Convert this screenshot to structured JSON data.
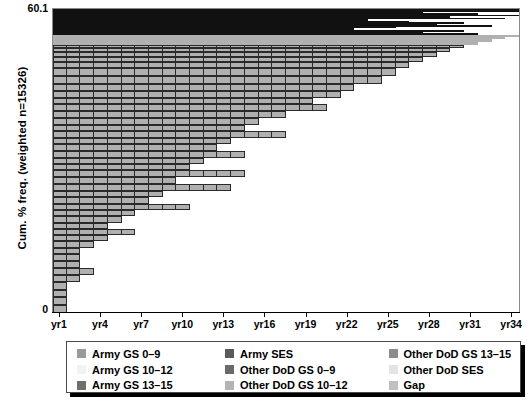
{
  "chart_data": {
    "type": "bar",
    "subtype": "stacked-cumulative-mosaic",
    "title": "",
    "xlabel": "",
    "ylabel": "Cum. % freq. (weighted n=15326)",
    "ylim": [
      0,
      60.1
    ],
    "y_ticks": [
      "0",
      "60.1"
    ],
    "x_tick_labels": [
      "yr1",
      "yr4",
      "yr7",
      "yr10",
      "yr13",
      "yr16",
      "yr19",
      "yr22",
      "yr25",
      "yr28",
      "yr31",
      "yr34"
    ],
    "x_tick_positions": [
      1,
      4,
      7,
      10,
      13,
      16,
      19,
      22,
      25,
      28,
      31,
      34
    ],
    "x_range": [
      1,
      34
    ],
    "grid": false,
    "legend_position": "bottom",
    "categories": [
      "yr1",
      "yr2",
      "yr3",
      "yr4",
      "yr5",
      "yr6",
      "yr7",
      "yr8",
      "yr9",
      "yr10",
      "yr11",
      "yr12",
      "yr13",
      "yr14",
      "yr15",
      "yr16",
      "yr17",
      "yr18",
      "yr19",
      "yr20",
      "yr21",
      "yr22",
      "yr23",
      "yr24",
      "yr25",
      "yr26",
      "yr27",
      "yr28",
      "yr29",
      "yr30",
      "yr31",
      "yr32",
      "yr33",
      "yr34"
    ],
    "series": [
      {
        "name": "Army GS 0-9",
        "color": "#9a9a9a"
      },
      {
        "name": "Army GS 10-12",
        "color": "#f0f0f0"
      },
      {
        "name": "Army GS 13-15",
        "color": "#6e6e6e"
      },
      {
        "name": "Army SES",
        "color": "#5a5a5a"
      },
      {
        "name": "Other DoD GS 0-9",
        "color": "#7a7a7a"
      },
      {
        "name": "Other DoD GS 10-12",
        "color": "#aeaeae"
      },
      {
        "name": "Other DoD GS 13-15",
        "color": "#8c8c8c"
      },
      {
        "name": "Other DoD SES",
        "color": "#e2e2e2"
      },
      {
        "name": "Gap",
        "color": "#bdbdbd"
      }
    ],
    "rows": [
      {
        "y": 0,
        "h": 2,
        "span": 34,
        "cells": 34,
        "fill": "#111111"
      },
      {
        "y": 2,
        "h": 1.2,
        "span": 34,
        "cells": 34,
        "fill": "#111111"
      },
      {
        "y": 3.2,
        "h": 1.2,
        "span": 27,
        "cells": 27,
        "fill": "#111111"
      },
      {
        "y": 4.4,
        "h": 1.4,
        "span": 31,
        "cells": 31,
        "fill": "#111111"
      },
      {
        "y": 5.8,
        "h": 1.2,
        "span": 34,
        "cells": 34,
        "fill": "#111111"
      },
      {
        "y": 7.0,
        "h": 1.6,
        "span": 29,
        "cells": 29,
        "fill": "#111111"
      },
      {
        "y": 8.6,
        "h": 1.2,
        "span": 33,
        "cells": 33,
        "fill": "#111111"
      },
      {
        "y": 9.8,
        "h": 2.0,
        "span": 23,
        "cells": 23,
        "fill": "#111111"
      },
      {
        "y": 11.8,
        "h": 1.4,
        "span": 26,
        "cells": 26,
        "fill": "#111111"
      },
      {
        "y": 13.2,
        "h": 1.6,
        "span": 30,
        "cells": 30,
        "fill": "#111111"
      },
      {
        "y": 14.8,
        "h": 1.4,
        "span": 28,
        "cells": 28,
        "fill": "#111111"
      },
      {
        "y": 16.2,
        "h": 1.6,
        "span": 32,
        "cells": 32,
        "fill": "#111111"
      },
      {
        "y": 17.8,
        "h": 1.4,
        "span": 25,
        "cells": 25,
        "fill": "#111111"
      },
      {
        "y": 19.2,
        "h": 1.8,
        "span": 22,
        "cells": 22,
        "fill": "#111111"
      },
      {
        "y": 21.0,
        "h": 1.6,
        "span": 30,
        "cells": 30,
        "fill": "#111111"
      },
      {
        "y": 22.6,
        "h": 1.8,
        "span": 27,
        "cells": 27,
        "fill": "#111111"
      },
      {
        "y": 24.4,
        "h": 1.6,
        "span": 31,
        "cells": 31,
        "fill": "#111111"
      },
      {
        "y": 26.0,
        "h": 2.0,
        "span": 34,
        "cells": 34,
        "fill": "#b0b0b0"
      },
      {
        "y": 28.0,
        "h": 2.4,
        "span": 33,
        "cells": 33,
        "fill": "#b0b0b0"
      },
      {
        "y": 30.4,
        "h": 2.4,
        "span": 32,
        "cells": 32,
        "fill": "#b0b0b0"
      },
      {
        "y": 32.8,
        "h": 3.0,
        "span": 31,
        "cells": 31,
        "fill": "#b0b0b0"
      },
      {
        "y": 35.8,
        "h": 3.4,
        "span": 30,
        "cells": 30,
        "fill": "#b0b0b0"
      },
      {
        "y": 39.2,
        "h": 4.0,
        "span": 29,
        "cells": 29,
        "fill": "#b0b0b0"
      },
      {
        "y": 43.2,
        "h": 4.6,
        "span": 28,
        "cells": 28,
        "fill": "#b0b0b0"
      },
      {
        "y": 47.8,
        "h": 5.4,
        "span": 27,
        "cells": 27,
        "fill": "#b0b0b0"
      },
      {
        "y": 53.2,
        "h": 6.4,
        "span": 26,
        "cells": 26,
        "fill": "#b0b0b0"
      },
      {
        "y": 59.6,
        "h": 7.4,
        "span": 25,
        "cells": 25,
        "fill": "#b0b0b0"
      },
      {
        "y": 67.0,
        "h": 8.2,
        "span": 24,
        "cells": 24,
        "fill": "#b0b0b0"
      },
      {
        "y": 75.2,
        "h": 6.6,
        "span": 22,
        "cells": 22,
        "fill": "#b0b0b0"
      },
      {
        "y": 81.8,
        "h": 7.6,
        "span": 21,
        "cells": 21,
        "fill": "#b0b0b0"
      },
      {
        "y": 89.4,
        "h": 6.2,
        "span": 19,
        "cells": 19,
        "fill": "#b0b0b0"
      },
      {
        "y": 95.6,
        "h": 7.0,
        "span": 20,
        "cells": 20,
        "fill": "#b0b0b0"
      },
      {
        "y": 102.6,
        "h": 6.4,
        "span": 17,
        "cells": 17,
        "fill": "#b0b0b0"
      },
      {
        "y": 109.0,
        "h": 7.2,
        "span": 15,
        "cells": 15,
        "fill": "#b0b0b0"
      },
      {
        "y": 116.2,
        "h": 6.0,
        "span": 14,
        "cells": 14,
        "fill": "#b0b0b0"
      },
      {
        "y": 122.2,
        "h": 7.4,
        "span": 17,
        "cells": 17,
        "fill": "#b0b0b0"
      },
      {
        "y": 129.6,
        "h": 6.2,
        "span": 13,
        "cells": 13,
        "fill": "#b0b0b0"
      },
      {
        "y": 135.8,
        "h": 6.6,
        "span": 12,
        "cells": 12,
        "fill": "#b0b0b0"
      },
      {
        "y": 142.4,
        "h": 7.0,
        "span": 14,
        "cells": 14,
        "fill": "#b0b0b0"
      },
      {
        "y": 149.4,
        "h": 6.4,
        "span": 11,
        "cells": 11,
        "fill": "#b0b0b0"
      },
      {
        "y": 155.8,
        "h": 6.0,
        "span": 10,
        "cells": 10,
        "fill": "#b0b0b0"
      },
      {
        "y": 161.8,
        "h": 7.2,
        "span": 14,
        "cells": 14,
        "fill": "#b0b0b0"
      },
      {
        "y": 169.0,
        "h": 6.4,
        "span": 9,
        "cells": 9,
        "fill": "#b0b0b0"
      },
      {
        "y": 175.4,
        "h": 7.0,
        "span": 13,
        "cells": 13,
        "fill": "#b0b0b0"
      },
      {
        "y": 182.4,
        "h": 6.6,
        "span": 8,
        "cells": 8,
        "fill": "#b0b0b0"
      },
      {
        "y": 189.0,
        "h": 6.2,
        "span": 7,
        "cells": 7,
        "fill": "#b0b0b0"
      },
      {
        "y": 195.2,
        "h": 6.8,
        "span": 10,
        "cells": 10,
        "fill": "#b0b0b0"
      },
      {
        "y": 202.0,
        "h": 6.0,
        "span": 6,
        "cells": 6,
        "fill": "#b0b0b0"
      },
      {
        "y": 208.0,
        "h": 6.4,
        "span": 5,
        "cells": 5,
        "fill": "#b0b0b0"
      },
      {
        "y": 214.4,
        "h": 6.0,
        "span": 4,
        "cells": 4,
        "fill": "#b0b0b0"
      },
      {
        "y": 220.4,
        "h": 6.4,
        "span": 6,
        "cells": 6,
        "fill": "#b0b0b0"
      },
      {
        "y": 226.8,
        "h": 6.2,
        "span": 4,
        "cells": 4,
        "fill": "#b0b0b0"
      },
      {
        "y": 233.0,
        "h": 6.8,
        "span": 3,
        "cells": 3,
        "fill": "#b0b0b0"
      },
      {
        "y": 239.8,
        "h": 6.4,
        "span": 2,
        "cells": 2,
        "fill": "#b0b0b0"
      },
      {
        "y": 246.2,
        "h": 7.0,
        "span": 2,
        "cells": 2,
        "fill": "#b0b0b0"
      },
      {
        "y": 253.2,
        "h": 6.6,
        "span": 2,
        "cells": 2,
        "fill": "#b0b0b0"
      },
      {
        "y": 259.8,
        "h": 7.2,
        "span": 3,
        "cells": 3,
        "fill": "#b0b0b0"
      },
      {
        "y": 267.0,
        "h": 6.6,
        "span": 2,
        "cells": 2,
        "fill": "#b0b0b0"
      },
      {
        "y": 273.6,
        "h": 8.0,
        "span": 1,
        "cells": 1,
        "fill": "#b0b0b0"
      },
      {
        "y": 281.6,
        "h": 7.6,
        "span": 1,
        "cells": 1,
        "fill": "#b0b0b0"
      },
      {
        "y": 289.2,
        "h": 7.4,
        "span": 1,
        "cells": 1,
        "fill": "#b0b0b0"
      },
      {
        "y": 296.6,
        "h": 8.0,
        "span": 1,
        "cells": 1,
        "fill": "#b0b0b0"
      }
    ]
  },
  "axes": {
    "y_title": "Cum. % freq. (weighted n=15326)",
    "y_top_label": "60.1",
    "y_bottom_label": "0"
  },
  "legend": {
    "columns": [
      [
        {
          "label": "Army GS 0–9",
          "color": "#9a9a9a"
        },
        {
          "label": "Army GS 10–12",
          "color": "#f2f2f2"
        },
        {
          "label": "Army GS 13–15",
          "color": "#6e6e6e"
        }
      ],
      [
        {
          "label": "Army SES",
          "color": "#5a5a5a"
        },
        {
          "label": "Other DoD GS 0–9",
          "color": "#6a6a6a"
        },
        {
          "label": "Other DoD GS 10–12",
          "color": "#b4b4b4"
        }
      ],
      [
        {
          "label": "Other DoD GS 13–15",
          "color": "#8c8c8c"
        },
        {
          "label": "Other DoD SES",
          "color": "#e4e4e4"
        },
        {
          "label": "Gap",
          "color": "#c0c0c0"
        }
      ]
    ]
  }
}
